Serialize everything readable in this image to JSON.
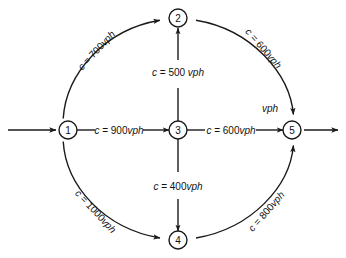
{
  "diagram": {
    "type": "directed-network-flow-graph",
    "stroke_color": "#1a1a1a",
    "background_color": "#ffffff",
    "nodes": [
      {
        "id": "1",
        "label": "1",
        "x": 68,
        "y": 130
      },
      {
        "id": "2",
        "label": "2",
        "x": 178,
        "y": 18
      },
      {
        "id": "3",
        "label": "3",
        "x": 178,
        "y": 130
      },
      {
        "id": "4",
        "label": "4",
        "x": 178,
        "y": 240
      },
      {
        "id": "5",
        "label": "5",
        "x": 292,
        "y": 130
      }
    ],
    "edges": [
      {
        "id": "edge-1-2",
        "from": "1",
        "to": "2",
        "shape": "arc",
        "label_prefix": "c = ",
        "label_value": "700",
        "label_unit": "vph",
        "label_full": "c = 700vph",
        "label_x": 96,
        "label_y": 50,
        "label_rotation": -47
      },
      {
        "id": "edge-2-5",
        "from": "2",
        "to": "5",
        "shape": "arc",
        "label_prefix": "c = ",
        "label_value": "600",
        "label_unit": "vph",
        "label_full": "c = 600vph",
        "label_x": 264,
        "label_y": 48,
        "label_rotation": 49
      },
      {
        "id": "edge-1-4",
        "from": "1",
        "to": "4",
        "shape": "arc",
        "label_prefix": "c = ",
        "label_value": "1000",
        "label_unit": "vph",
        "label_full": "c = 1000vph",
        "label_x": 96,
        "label_y": 211,
        "label_rotation": 47
      },
      {
        "id": "edge-4-5",
        "from": "4",
        "to": "5",
        "shape": "arc",
        "label_prefix": "c = ",
        "label_value": "800",
        "label_unit": "vph",
        "label_full": "c = 800vph",
        "label_x": 266,
        "label_y": 211,
        "label_rotation": -49
      },
      {
        "id": "edge-1-3",
        "from": "1",
        "to": "3",
        "shape": "straight",
        "label_prefix": "c = ",
        "label_value": "900",
        "label_unit": "vph",
        "label_full": "c = 900vph",
        "label_x": 119,
        "label_y": 130,
        "label_rotation": 0
      },
      {
        "id": "edge-3-5",
        "from": "3",
        "to": "5",
        "shape": "straight",
        "label_prefix": "c = ",
        "label_value": "600",
        "label_unit": "vph",
        "label_full": "c = 600vph",
        "label_x": 231,
        "label_y": 130,
        "label_rotation": 0
      },
      {
        "id": "edge-3-2",
        "from": "3",
        "to": "2",
        "shape": "straight",
        "label_prefix": "c = ",
        "label_value": "500",
        "label_unit": " vph",
        "label_full": "c = 500 vph",
        "label_x": 178,
        "label_y": 72,
        "label_rotation": 0
      },
      {
        "id": "edge-3-4",
        "from": "3",
        "to": "4",
        "shape": "straight",
        "label_prefix": "c = ",
        "label_value": "400",
        "label_unit": "vph",
        "label_full": "c = 400vph",
        "label_x": 178,
        "label_y": 186,
        "label_rotation": 0
      }
    ],
    "external": {
      "inflow_label": "",
      "outflow_label": "",
      "stray_label": "vph",
      "stray_label_x": 270,
      "stray_label_y": 108
    },
    "units_legend": "vph"
  }
}
